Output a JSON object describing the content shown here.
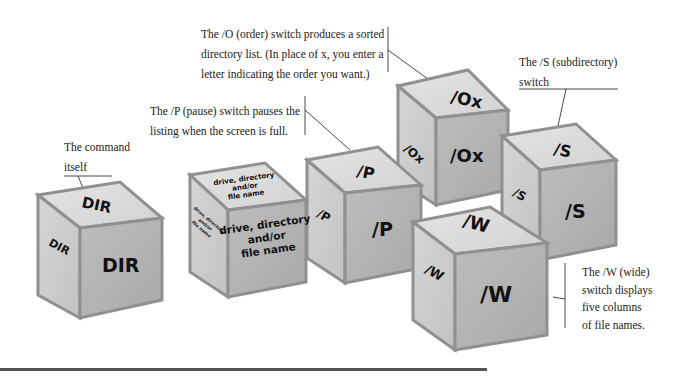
{
  "captions": {
    "dir": {
      "lines": [
        "The command",
        "itself"
      ]
    },
    "pause": {
      "lines": [
        "The /P (pause) switch pauses the",
        "listing when the screen is full."
      ]
    },
    "order": {
      "lines": [
        "The /O (order) switch produces a sorted",
        "directory list. (In place of x, you enter a",
        "letter indicating the order you want.)"
      ]
    },
    "subdir": {
      "lines": [
        "The /S (subdirectory)",
        "switch"
      ]
    },
    "wide": {
      "lines": [
        "The /W (wide)",
        "switch displays",
        "five columns",
        "of file names."
      ]
    }
  },
  "cubes": {
    "dir": {
      "top": "DIR",
      "left": "DIR",
      "front": "DIR"
    },
    "path": {
      "top_lines": [
        "drive, directory",
        "and/or",
        "file name"
      ],
      "left_lines": [
        "drive, directory",
        "and/or",
        "file name"
      ],
      "front_lines": [
        "drive, directory",
        "and/or",
        "file name"
      ]
    },
    "pause": {
      "top": "/P",
      "left": "/P",
      "front": "/P"
    },
    "order": {
      "top": "/Ox",
      "left": "/Ox",
      "front": "/Ox"
    },
    "subdir": {
      "top": "/S",
      "left": "/S",
      "front": "/S"
    },
    "wide": {
      "top": "/W",
      "left": "/W",
      "front": "/W"
    }
  },
  "colors": {
    "cube_top": "#d8d8d8",
    "cube_left": "#c9c9c9",
    "cube_front": "#b3b3b3",
    "cube_edge": "#8f8f8f",
    "rule": "#555555"
  }
}
